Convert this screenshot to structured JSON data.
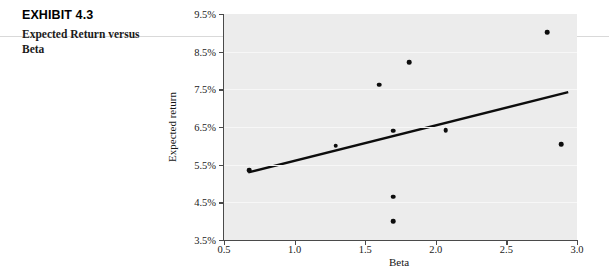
{
  "caption": {
    "exhibit_number": "EXHIBIT 4.3",
    "exhibit_title": "Expected Return versus Beta"
  },
  "chart_data": {
    "type": "scatter",
    "title": "Expected Return versus Beta",
    "xlabel": "Beta",
    "ylabel": "Expected return",
    "xlim": [
      0.5,
      3.0
    ],
    "ylim": [
      3.5,
      9.5
    ],
    "xticks": [
      0.5,
      1.0,
      1.5,
      2.0,
      2.5,
      3.0
    ],
    "xtick_labels": [
      "0.5",
      "1.0",
      "1.5",
      "2.0",
      "2.5",
      "3.0"
    ],
    "yticks": [
      3.5,
      4.5,
      5.5,
      6.5,
      7.5,
      8.5,
      9.5
    ],
    "ytick_labels": [
      "3.5%",
      "4.5%",
      "5.5%",
      "6.5%",
      "7.5%",
      "8.5%",
      "9.5%"
    ],
    "grid": true,
    "legend": null,
    "plot_background": "#ececec",
    "point_color": "#0d0d0d",
    "line_color": "#0d0d0d",
    "points": [
      {
        "beta": 0.68,
        "expected_return": 5.35
      },
      {
        "beta": 1.29,
        "expected_return": 6.0
      },
      {
        "beta": 1.6,
        "expected_return": 7.62
      },
      {
        "beta": 1.7,
        "expected_return": 6.4
      },
      {
        "beta": 1.7,
        "expected_return": 4.65
      },
      {
        "beta": 1.7,
        "expected_return": 4.0
      },
      {
        "beta": 1.81,
        "expected_return": 8.22
      },
      {
        "beta": 2.07,
        "expected_return": 6.42
      },
      {
        "beta": 2.79,
        "expected_return": 9.02
      },
      {
        "beta": 2.89,
        "expected_return": 6.05
      }
    ],
    "trendline": {
      "type": "linear-fit",
      "x_start": 0.68,
      "y_start": 5.3,
      "x_end": 2.93,
      "y_end": 7.42
    }
  }
}
